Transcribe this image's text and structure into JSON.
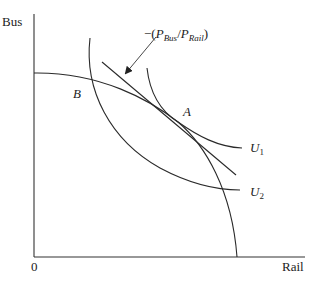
{
  "diagram": {
    "type": "economics-indifference-curve",
    "axes": {
      "y_label": "Bus",
      "x_label": "Rail",
      "origin_label": "0"
    },
    "curves": {
      "ppf": {
        "name": "production-possibility-frontier"
      },
      "u1": {
        "label_base": "U",
        "label_sub": "1"
      },
      "u2": {
        "label_base": "U",
        "label_sub": "2"
      },
      "price_line": {
        "name": "price-ratio-line"
      }
    },
    "points": {
      "a": "A",
      "b": "B"
    },
    "price_ratio_label": {
      "prefix": "−(",
      "p1": "P",
      "p1_sub": "Bus",
      "slash": "/",
      "p2": "P",
      "p2_sub": "Rail",
      "suffix": ")"
    }
  }
}
